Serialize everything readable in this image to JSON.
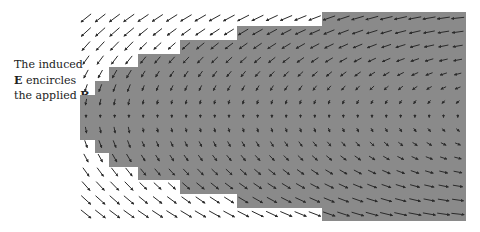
{
  "caption": {
    "line1": "The induced",
    "line2_bold": "E",
    "line2_rest": " encircles",
    "line3_rest": "the applied ",
    "line3_bold": "B"
  },
  "colors": {
    "background": "#ffffff",
    "region_fill": "#8a8a8a",
    "arrow": "#2a2a2a",
    "text": "#222222"
  },
  "grid": {
    "x0": 86,
    "dx": 14.3,
    "cols": 27,
    "y0": 18,
    "dy": 14,
    "rows": 15,
    "center_row": 7
  },
  "region": {
    "description": "Stepped gray region where magnetic field B is applied",
    "right_edge": 466,
    "top_steps": [
      {
        "x": 322,
        "y": 12
      },
      {
        "x": 237,
        "y": 26
      },
      {
        "x": 180,
        "y": 40
      },
      {
        "x": 138,
        "y": 54
      },
      {
        "x": 109,
        "y": 67
      },
      {
        "x": 95,
        "y": 81
      },
      {
        "x": 80,
        "y": 95
      }
    ],
    "bottom_steps": [
      {
        "x": 80,
        "y": 140
      },
      {
        "x": 95,
        "y": 153
      },
      {
        "x": 109,
        "y": 167
      },
      {
        "x": 138,
        "y": 180
      },
      {
        "x": 180,
        "y": 194
      },
      {
        "x": 237,
        "y": 208
      },
      {
        "x": 322,
        "y": 221
      }
    ]
  },
  "field": {
    "name": "induced E vector field",
    "circulation": "top-left-bottom (top points left, left side points down, bottom points right)",
    "center_x": 520,
    "center_y": 116,
    "max_arrow_len": 13
  }
}
